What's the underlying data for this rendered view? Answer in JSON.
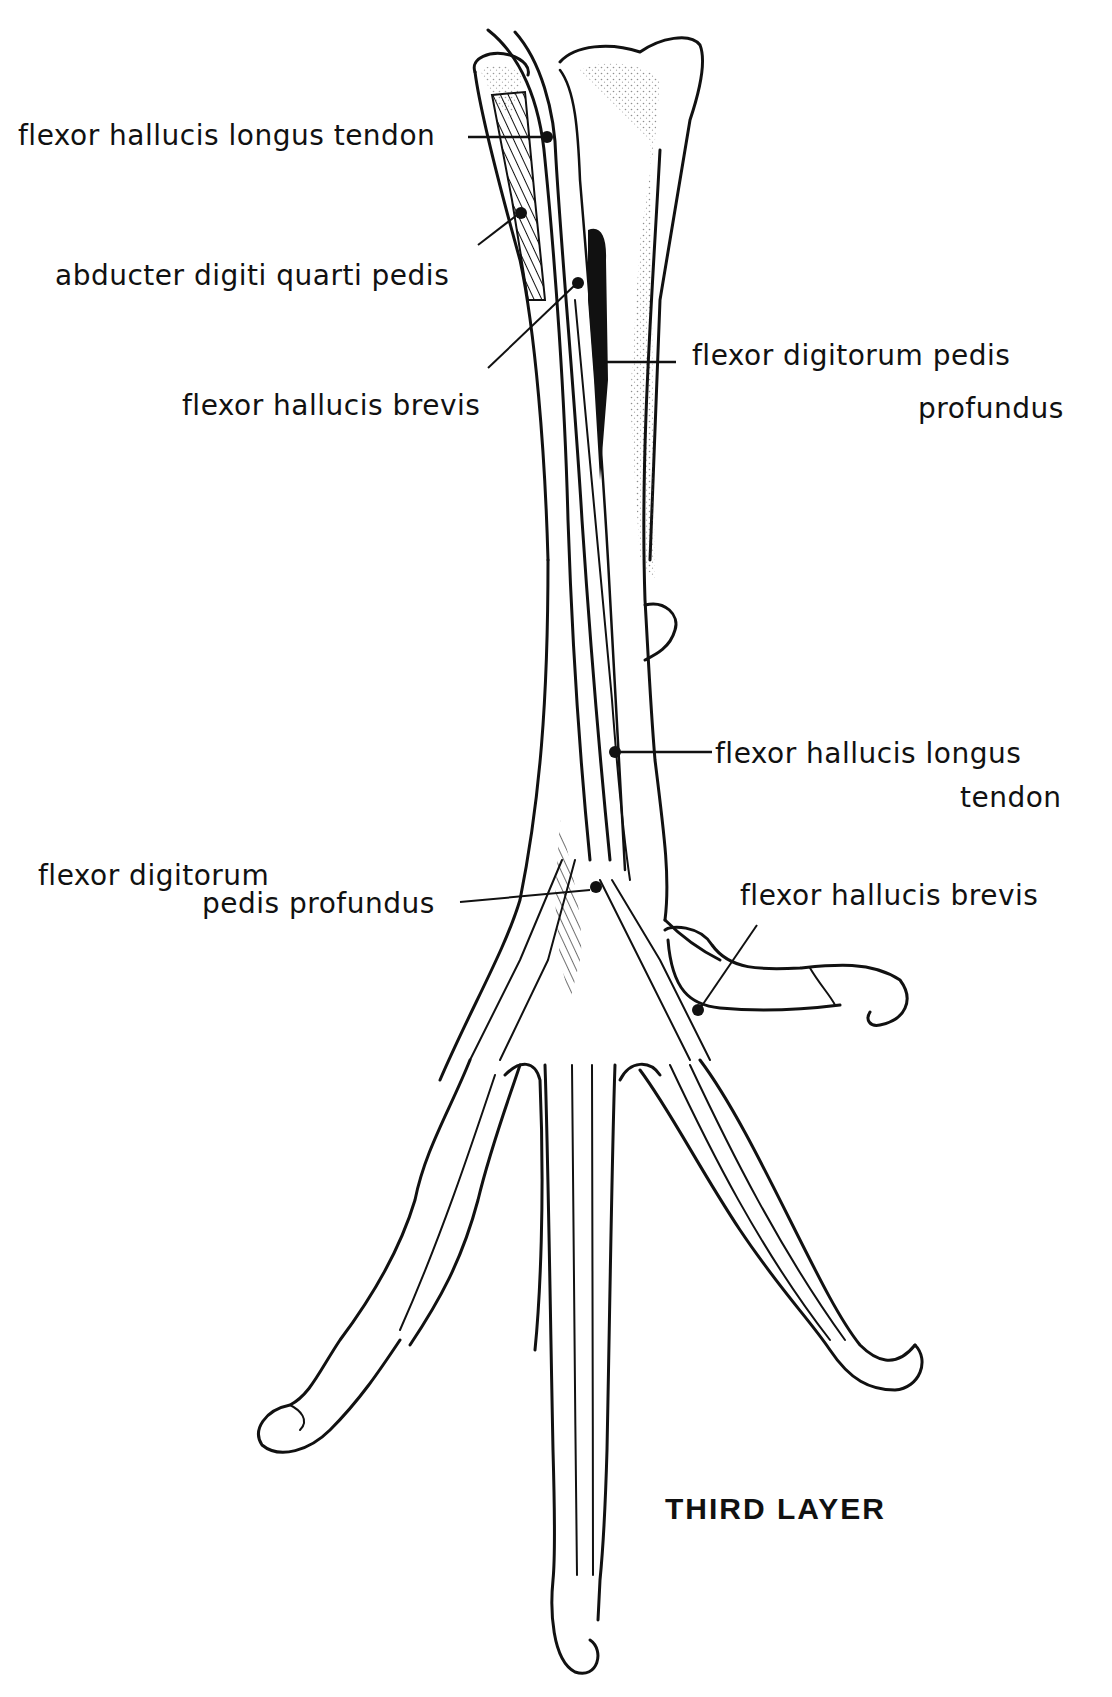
{
  "figure": {
    "title": "THIRD LAYER",
    "colors": {
      "ink": "#111111",
      "background": "#ffffff"
    }
  },
  "labels": {
    "fhl_tendon_top": "flexor hallucis longus tendon",
    "abducter": "abducter digiti quarti pedis",
    "fhb_top": "flexor hallucis brevis",
    "fdpp_top_line1": "flexor digitorum pedis",
    "fdpp_top_line2": "profundus",
    "fhl_tendon_mid_line1": "flexor hallucis longus",
    "fhl_tendon_mid_line2": "tendon",
    "fdpp_mid_line1": "flexor digitorum",
    "fdpp_mid_line2": "pedis profundus",
    "fhb_hallux": "flexor hallucis brevis"
  }
}
